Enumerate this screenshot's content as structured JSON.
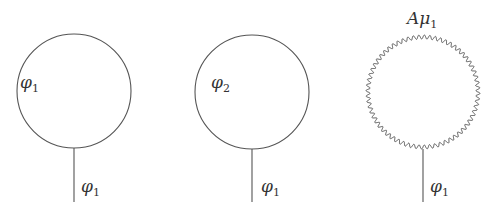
{
  "diagrams": [
    {
      "id": "tadpole-phi1-loop",
      "loop": {
        "type": "scalar",
        "label_main": "φ",
        "label_sub": "1"
      },
      "leg": {
        "label_main": "φ",
        "label_sub": "1"
      }
    },
    {
      "id": "tadpole-phi2-loop",
      "loop": {
        "type": "scalar",
        "label_main": "φ",
        "label_sub": "2"
      },
      "leg": {
        "label_main": "φ",
        "label_sub": "1"
      }
    },
    {
      "id": "tadpole-gauge-loop",
      "loop": {
        "type": "gauge",
        "label_main": "Aμ",
        "label_sub": "1"
      },
      "leg": {
        "label_main": "φ",
        "label_sub": "1"
      }
    }
  ],
  "colors": {
    "line": "#555555",
    "text": "#333333"
  }
}
